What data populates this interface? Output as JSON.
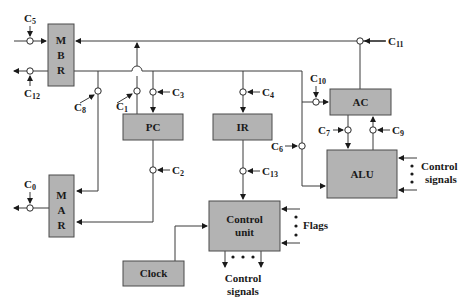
{
  "diagram": {
    "type": "CPU datapath with control signals",
    "blocks": {
      "mbr": {
        "letters": [
          "M",
          "B",
          "R"
        ]
      },
      "mar": {
        "letters": [
          "M",
          "A",
          "R"
        ]
      },
      "pc": {
        "label": "PC"
      },
      "ir": {
        "label": "IR"
      },
      "ac": {
        "label": "AC"
      },
      "alu": {
        "label": "ALU"
      },
      "control_unit": {
        "line1": "Control",
        "line2": "unit"
      },
      "clock": {
        "label": "Clock"
      }
    },
    "control_points": [
      {
        "id": "c0",
        "base": "C",
        "sub": "0"
      },
      {
        "id": "c1",
        "base": "C",
        "sub": "1"
      },
      {
        "id": "c2",
        "base": "C",
        "sub": "2"
      },
      {
        "id": "c3",
        "base": "C",
        "sub": "3"
      },
      {
        "id": "c4",
        "base": "C",
        "sub": "4"
      },
      {
        "id": "c5",
        "base": "C",
        "sub": "5"
      },
      {
        "id": "c6",
        "base": "C",
        "sub": "6"
      },
      {
        "id": "c7",
        "base": "C",
        "sub": "7"
      },
      {
        "id": "c8",
        "base": "C",
        "sub": "8"
      },
      {
        "id": "c9",
        "base": "C",
        "sub": "9"
      },
      {
        "id": "c10",
        "base": "C",
        "sub": "10"
      },
      {
        "id": "c11",
        "base": "C",
        "sub": "11"
      },
      {
        "id": "c12",
        "base": "C",
        "sub": "12"
      },
      {
        "id": "c13",
        "base": "C",
        "sub": "13"
      }
    ],
    "annotations": {
      "alu_control_line1": "Control",
      "alu_control_line2": "signals",
      "flags": "Flags",
      "cu_output_line1": "Control",
      "cu_output_line2": "signals"
    },
    "colors": {
      "box_fill": "#b3b3b3",
      "line": "#3a3a3a",
      "background": "#ffffff"
    }
  }
}
